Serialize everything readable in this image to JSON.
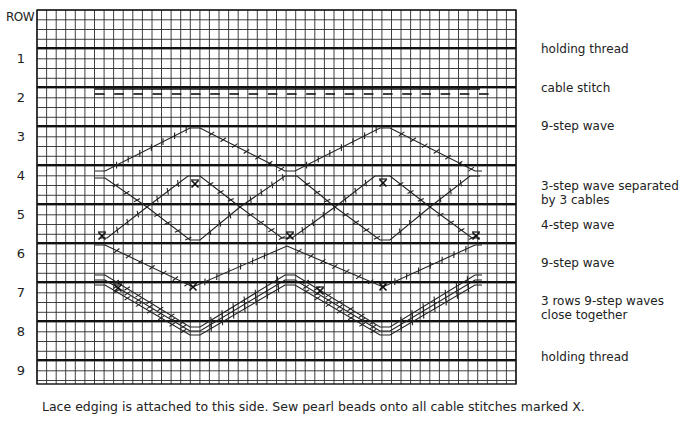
{
  "header": {
    "row_label": "ROW"
  },
  "rows": [
    {
      "number": "1",
      "y": 48
    },
    {
      "number": "2",
      "y": 87
    },
    {
      "number": "3",
      "y": 126
    },
    {
      "number": "4",
      "y": 165
    },
    {
      "number": "5",
      "y": 204
    },
    {
      "number": "6",
      "y": 243
    },
    {
      "number": "7",
      "y": 282
    },
    {
      "number": "8",
      "y": 321
    },
    {
      "number": "9",
      "y": 360
    }
  ],
  "legend": [
    {
      "text": "holding thread",
      "y": 42
    },
    {
      "text": "cable stitch",
      "y": 81
    },
    {
      "text": "9-step wave",
      "y": 119
    },
    {
      "text": "3-step wave separated\nby 3 cables",
      "y": 179
    },
    {
      "text": "4-step wave",
      "y": 218
    },
    {
      "text": "9-step wave",
      "y": 256
    },
    {
      "text": "3 rows 9-step waves\nclose together",
      "y": 294
    },
    {
      "text": "holding thread",
      "y": 350
    }
  ],
  "caption": "Lace edging is attached to this side. Sew pearl beads onto all cable stitches marked X.",
  "grid": {
    "x0": 37,
    "x1": 516,
    "y0": 10,
    "y1": 384,
    "cell_w": 9.58,
    "cell_h": 9.75,
    "line_color": "#2a2a2a",
    "thick_color": "#111111"
  },
  "patterns": {
    "cable_stitch": {
      "y_top": 89,
      "y_bot": 94,
      "x_start": 95,
      "x_end": 480
    },
    "wave_9step_top": [
      [
        95,
        171
      ],
      [
        105,
        171
      ],
      [
        190,
        128
      ],
      [
        200,
        128
      ],
      [
        285,
        171
      ],
      [
        295,
        171
      ],
      [
        380,
        128
      ],
      [
        390,
        128
      ],
      [
        475,
        171
      ],
      [
        482,
        171
      ]
    ],
    "wave_3step_a": [
      [
        95,
        178
      ],
      [
        105,
        178
      ],
      [
        147,
        207
      ],
      [
        190,
        240
      ],
      [
        200,
        240
      ],
      [
        240,
        207
      ],
      [
        285,
        176
      ],
      [
        297,
        176
      ],
      [
        335,
        207
      ],
      [
        380,
        240
      ],
      [
        390,
        240
      ],
      [
        430,
        207
      ],
      [
        470,
        176
      ],
      [
        480,
        176
      ]
    ],
    "wave_3step_b": [
      [
        100,
        238
      ],
      [
        107,
        238
      ],
      [
        147,
        207
      ],
      [
        188,
        176
      ],
      [
        200,
        176
      ],
      [
        240,
        207
      ],
      [
        282,
        238
      ],
      [
        292,
        238
      ],
      [
        335,
        207
      ],
      [
        375,
        176
      ],
      [
        390,
        176
      ],
      [
        430,
        207
      ],
      [
        472,
        238
      ],
      [
        480,
        238
      ]
    ],
    "wave_9step_mid": [
      [
        95,
        245
      ],
      [
        105,
        245
      ],
      [
        193,
        287
      ],
      [
        287,
        246
      ],
      [
        383,
        287
      ],
      [
        475,
        245
      ],
      [
        482,
        245
      ]
    ],
    "wave_9step_close": [
      [
        [
          95,
          275
        ],
        [
          105,
          275
        ],
        [
          190,
          327
        ],
        [
          200,
          327
        ],
        [
          285,
          275
        ],
        [
          295,
          275
        ],
        [
          380,
          327
        ],
        [
          390,
          327
        ],
        [
          475,
          275
        ],
        [
          482,
          275
        ]
      ],
      [
        [
          95,
          280
        ],
        [
          105,
          280
        ],
        [
          190,
          331
        ],
        [
          200,
          331
        ],
        [
          285,
          280
        ],
        [
          295,
          280
        ],
        [
          380,
          331
        ],
        [
          390,
          331
        ],
        [
          475,
          280
        ],
        [
          482,
          280
        ]
      ],
      [
        [
          95,
          285
        ],
        [
          105,
          285
        ],
        [
          190,
          335
        ],
        [
          200,
          335
        ],
        [
          285,
          285
        ],
        [
          295,
          285
        ],
        [
          380,
          335
        ],
        [
          390,
          335
        ],
        [
          475,
          285
        ],
        [
          482,
          285
        ]
      ]
    ],
    "x_markers": [
      [
        195,
        184
      ],
      [
        383,
        183
      ],
      [
        102,
        236
      ],
      [
        290,
        236
      ],
      [
        476,
        236
      ],
      [
        193,
        287
      ],
      [
        383,
        287
      ],
      [
        118,
        288
      ],
      [
        320,
        291
      ]
    ]
  }
}
